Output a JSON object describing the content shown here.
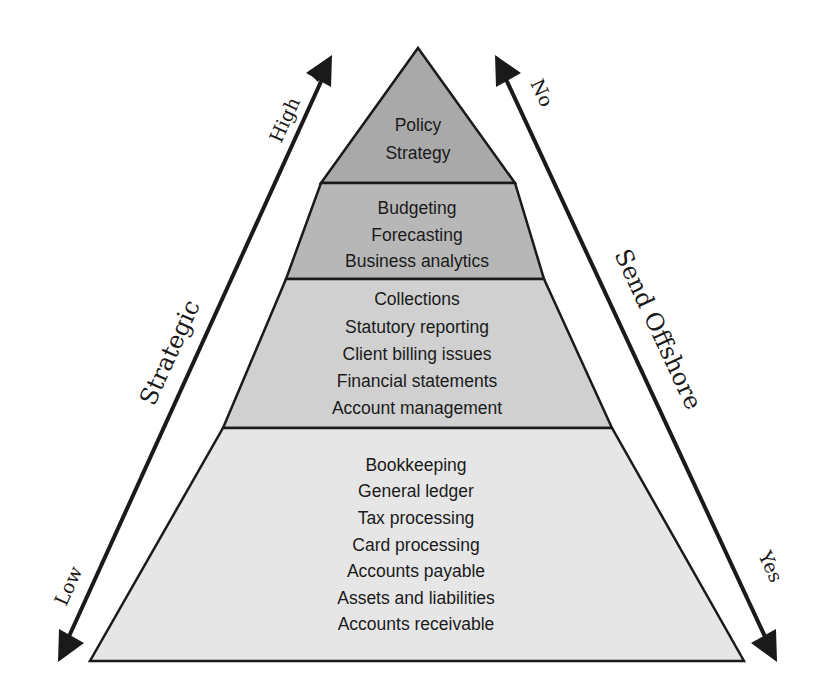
{
  "diagram": {
    "type": "pyramid",
    "layers": [
      {
        "name": "top",
        "fill": "#a9a9a9",
        "items": [
          "Policy",
          "Strategy"
        ]
      },
      {
        "name": "upper-middle",
        "fill": "#b7b7b7",
        "items": [
          "Budgeting",
          "Forecasting",
          "Business analytics"
        ]
      },
      {
        "name": "lower-middle",
        "fill": "#d0d0d0",
        "items": [
          "Collections",
          "Statutory reporting",
          "Client billing issues",
          "Financial statements",
          "Account management"
        ]
      },
      {
        "name": "bottom",
        "fill": "#e6e6e6",
        "items": [
          "Bookkeeping",
          "General ledger",
          "Tax processing",
          "Card processing",
          "Accounts payable",
          "Assets and liabilities",
          "Accounts receivable"
        ]
      }
    ],
    "left_axis": {
      "title": "Strategic",
      "high_label": "High",
      "low_label": "Low"
    },
    "right_axis": {
      "title": "Send Offshore",
      "top_label": "No",
      "bottom_label": "Yes"
    },
    "colors": {
      "outline": "#1a1a1a",
      "arrow": "#1a1a1a",
      "text": "#1a1a1a"
    }
  }
}
